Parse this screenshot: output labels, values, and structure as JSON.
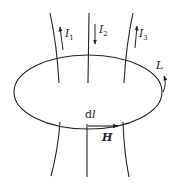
{
  "diagram": {
    "type": "ampere-loop",
    "loop": {
      "label": "L",
      "center": [
        88,
        92
      ],
      "rx": 74,
      "ry": 37
    },
    "currents": [
      {
        "label": "I",
        "subscript": "1",
        "direction": "up"
      },
      {
        "label": "I",
        "subscript": "2",
        "direction": "down"
      },
      {
        "label": "I",
        "subscript": "3",
        "direction": "up"
      }
    ],
    "element_label": "dl",
    "field_label": "H",
    "colors": {
      "stroke": "#222222",
      "background": "#ffffff"
    }
  }
}
